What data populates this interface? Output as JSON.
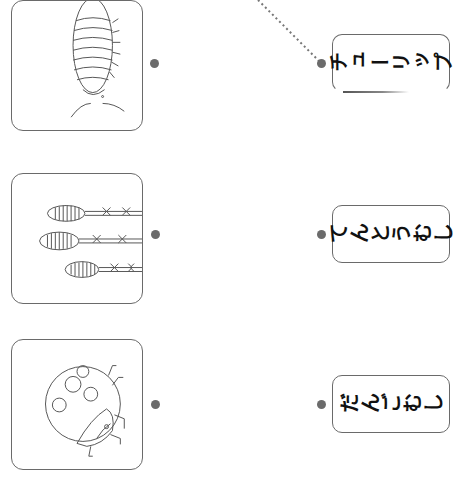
{
  "worksheet": {
    "pictures": [
      {
        "name": "pill-bug",
        "label": "dangomushi picture"
      },
      {
        "name": "tulip",
        "label": "tulip picture"
      },
      {
        "name": "ladybug",
        "label": "ladybug picture"
      }
    ],
    "words": [
      {
        "text": "チューリップ"
      },
      {
        "text": "てんとうむし"
      },
      {
        "text": "だんごむし"
      }
    ],
    "connection": {
      "from": [
        258,
        0
      ],
      "to": [
        321,
        63
      ],
      "style": "dotted"
    },
    "colors": {
      "border": "#6a6a6a",
      "dot": "#6b6b6b",
      "text": "#111111"
    }
  }
}
